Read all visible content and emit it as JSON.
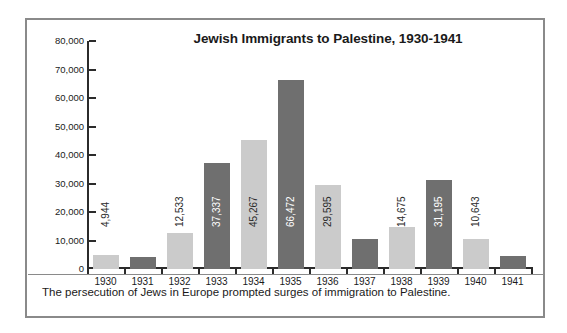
{
  "figure": {
    "caption": "The persecution of Jews in Europe prompted surges of immigration to Palestine.",
    "frame_color": "#8a8a8a"
  },
  "chart_data": {
    "type": "bar",
    "title": "Jewish Immigrants to Palestine, 1930-1941",
    "xlabel": "",
    "ylabel": "",
    "ylim": [
      0,
      80000
    ],
    "grid": false,
    "legend": "none",
    "categories": [
      "1930",
      "1931",
      "1932",
      "1933",
      "1934",
      "1935",
      "1936",
      "1937",
      "1938",
      "1939",
      "1940",
      "1941"
    ],
    "values": [
      4944,
      4075,
      12533,
      37337,
      45267,
      66472,
      29595,
      10629,
      14675,
      31195,
      10643,
      4592
    ],
    "value_labels": [
      "4,944",
      "4,075",
      "12,533",
      "37,337",
      "45,267",
      "66,472",
      "29,595",
      "10,629",
      "14,675",
      "31,195",
      "10,643",
      "4,592"
    ],
    "bar_colors": [
      "#cbcbcb",
      "#6f6f6f",
      "#cbcbcb",
      "#6f6f6f",
      "#cbcbcb",
      "#6f6f6f",
      "#cbcbcb",
      "#6f6f6f",
      "#cbcbcb",
      "#6f6f6f",
      "#cbcbcb",
      "#6f6f6f"
    ],
    "yticks": [
      0,
      10000,
      20000,
      30000,
      40000,
      50000,
      60000,
      70000,
      80000
    ],
    "ytick_labels": [
      "0",
      "10,000",
      "20,000",
      "30,000",
      "40,000",
      "50,000",
      "60,000",
      "70,000",
      "80,000"
    ]
  }
}
